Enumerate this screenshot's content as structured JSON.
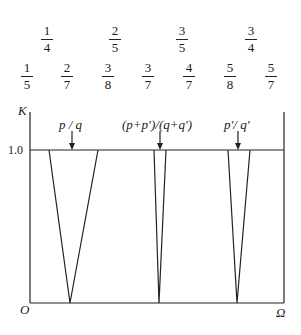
{
  "farey_row1": [
    {
      "num": "1",
      "den": "4",
      "x": 47
    },
    {
      "num": "2",
      "den": "5",
      "x": 115
    },
    {
      "num": "3",
      "den": "5",
      "x": 182
    },
    {
      "num": "3",
      "den": "4",
      "x": 251
    }
  ],
  "farey_row2": [
    {
      "num": "1",
      "den": "5",
      "x": 27
    },
    {
      "num": "2",
      "den": "7",
      "x": 67
    },
    {
      "num": "3",
      "den": "8",
      "x": 108
    },
    {
      "num": "3",
      "den": "7",
      "x": 148
    },
    {
      "num": "4",
      "den": "7",
      "x": 189
    },
    {
      "num": "5",
      "den": "8",
      "x": 230
    },
    {
      "num": "5",
      "den": "7",
      "x": 271
    }
  ],
  "axes": {
    "y_label": "K",
    "x_label": "Ω",
    "origin": "O",
    "y_tick": "1.0"
  },
  "arrows": [
    {
      "label": "p / q"
    },
    {
      "label": "(p+p′)/(q+q′)"
    },
    {
      "label": "p′/ q′"
    }
  ]
}
